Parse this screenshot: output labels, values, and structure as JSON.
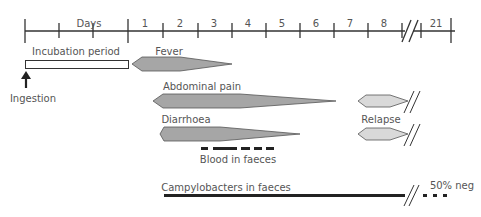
{
  "axis": {
    "days_label": "Days",
    "day_labels": [
      "1",
      "2",
      "3",
      "4",
      "5",
      "6",
      "7",
      "8",
      "21"
    ]
  },
  "labels": {
    "incubation": "Incubation period",
    "ingestion": "Ingestion",
    "fever": "Fever",
    "abdominal_pain": "Abdominal pain",
    "diarrhoea": "Diarrhoea",
    "relapse": "Relapse",
    "blood": "Blood in faeces",
    "campylobacters": "Campylobacters  in faeces",
    "neg": "50% neg"
  },
  "colors": {
    "line": "#333333",
    "symptom_fill": "#a6a6a6",
    "relapse_fill": "#d9d9d9",
    "text": "#555555"
  }
}
